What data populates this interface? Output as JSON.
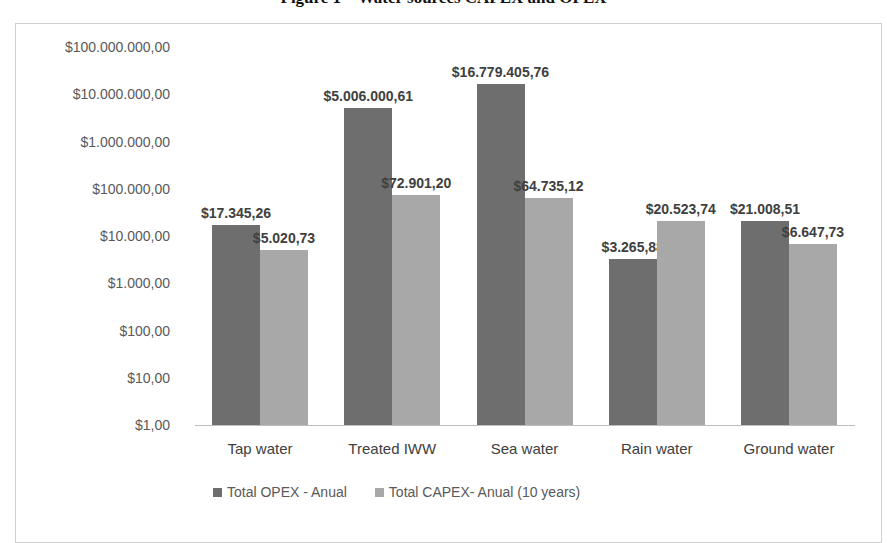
{
  "figure": {
    "title": "Figure 1 – Water sources CAPEX and OPEX"
  },
  "chart_data": {
    "type": "bar",
    "title": "Water sources CAPEX and OPEX",
    "xlabel": "",
    "ylabel": "",
    "yscale": "log",
    "ylim": [
      1,
      100000000
    ],
    "grid": false,
    "legend_position": "bottom",
    "categories": [
      "Tap water",
      "Treated IWW",
      "Sea water",
      "Rain water",
      "Ground water"
    ],
    "series": [
      {
        "name": "Total OPEX - Anual",
        "color": "#6e6e6e",
        "values": [
          17345.26,
          5006000.61,
          16779405.76,
          3265.88,
          21008.51
        ],
        "labels": [
          "$17.345,26",
          "$5.006.000,61",
          "$16.779.405,76",
          "$3.265,88",
          "$21.008,51"
        ]
      },
      {
        "name": "Total CAPEX- Anual (10 years)",
        "color": "#a8a8a8",
        "values": [
          5020.73,
          72901.2,
          64735.12,
          20523.74,
          6647.73
        ],
        "labels": [
          "$5.020,73",
          "$72.901,20",
          "$64.735,12",
          "$20.523,74",
          "$6.647,73"
        ]
      }
    ],
    "yticks": [
      "$1,00",
      "$10,00",
      "$100,00",
      "$1.000,00",
      "$10.000,00",
      "$100.000,00",
      "$1.000.000,00",
      "$10.000.000,00",
      "$100.000.000,00"
    ]
  },
  "legend": {
    "opex_label": "Total OPEX - Anual",
    "capex_label": "Total CAPEX- Anual (10 years)"
  }
}
